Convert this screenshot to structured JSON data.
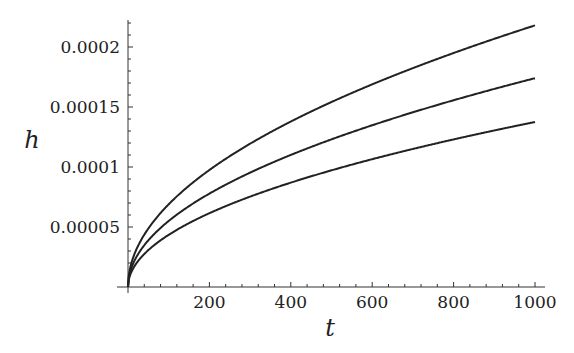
{
  "chart_data": {
    "type": "line",
    "title": "",
    "xlabel": "t",
    "ylabel": "h",
    "xlim": [
      0,
      1000
    ],
    "ylim": [
      0,
      0.00022
    ],
    "grid": false,
    "legend": null,
    "x_ticks": [
      "200",
      "400",
      "600",
      "800",
      "1000"
    ],
    "y_ticks": [
      "0.00005",
      "0.0001",
      "0.00015",
      "0.0002"
    ],
    "x": [
      0,
      50,
      100,
      200,
      300,
      400,
      500,
      600,
      700,
      800,
      900,
      1000
    ],
    "series": [
      {
        "name": "upper",
        "values": [
          0,
          4.88e-05,
          6.9e-05,
          9.76e-05,
          0.0001195,
          0.000138,
          0.0001543,
          0.000169,
          0.0001826,
          0.0001952,
          0.000207,
          0.000218
        ]
      },
      {
        "name": "middle",
        "values": [
          0,
          3.89e-05,
          5.5e-05,
          7.78e-05,
          9.53e-05,
          0.00011,
          0.000123,
          0.0001347,
          0.0001455,
          0.0001556,
          0.000165,
          0.000174
        ]
      },
      {
        "name": "lower",
        "values": [
          0,
          3.07e-05,
          4.35e-05,
          6.15e-05,
          7.53e-05,
          8.7e-05,
          9.73e-05,
          0.0001066,
          0.0001151,
          0.000123,
          0.0001305,
          0.0001375
        ]
      }
    ]
  }
}
